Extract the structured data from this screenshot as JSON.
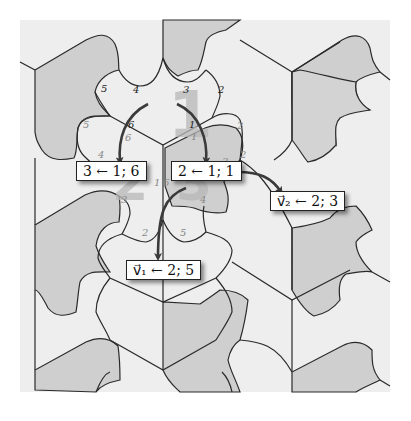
{
  "figure": {
    "colors": {
      "background": "#ffffff",
      "plane": "#eeeeee",
      "tile_light": "#f2f2f2",
      "tile_dark": "#cfcfcf",
      "outline": "#2a2a2a",
      "arrow": "#3a3a3a",
      "ghost_number": "#b8b8b8",
      "edge_label_dark": "#222222",
      "edge_label_light": "#888888"
    },
    "ghost_numbers": [
      {
        "text": "1",
        "x": 192,
        "y": 135,
        "size": 64
      },
      {
        "text": "2",
        "x": 98,
        "y": 192,
        "size": 52
      },
      {
        "text": "3",
        "x": 190,
        "y": 192,
        "size": 52
      }
    ],
    "edge_labels": [
      {
        "text": "5",
        "x": 101,
        "y": 92,
        "tone": "dark"
      },
      {
        "text": "4",
        "x": 133,
        "y": 93,
        "tone": "dark"
      },
      {
        "text": "3",
        "x": 183,
        "y": 93,
        "tone": "dark"
      },
      {
        "text": "2",
        "x": 218,
        "y": 93,
        "tone": "dark"
      },
      {
        "text": "5",
        "x": 83,
        "y": 128,
        "tone": "light"
      },
      {
        "text": "6",
        "x": 128,
        "y": 128,
        "tone": "dark"
      },
      {
        "text": "6",
        "x": 125,
        "y": 141,
        "tone": "light"
      },
      {
        "text": "1",
        "x": 189,
        "y": 128,
        "tone": "dark"
      },
      {
        "text": "1",
        "x": 191,
        "y": 140,
        "tone": "light"
      },
      {
        "text": "2",
        "x": 237,
        "y": 129,
        "tone": "light"
      },
      {
        "text": "2",
        "x": 240,
        "y": 158,
        "tone": "light"
      },
      {
        "text": "4",
        "x": 98,
        "y": 158,
        "tone": "light"
      },
      {
        "text": "3",
        "x": 222,
        "y": 165,
        "tone": "light"
      },
      {
        "text": "1",
        "x": 154,
        "y": 184,
        "tone": "light"
      },
      {
        "text": "6",
        "x": 163,
        "y": 184,
        "tone": "light"
      },
      {
        "text": "3",
        "x": 121,
        "y": 202,
        "tone": "light"
      },
      {
        "text": "4",
        "x": 200,
        "y": 202,
        "tone": "light"
      },
      {
        "text": "2",
        "x": 142,
        "y": 235,
        "tone": "light"
      },
      {
        "text": "5",
        "x": 180,
        "y": 235,
        "tone": "light"
      }
    ],
    "boxes": [
      {
        "id": "box-3-from-1-6",
        "text": "3 ← 1; 6",
        "left": 76,
        "top": 161
      },
      {
        "id": "box-2-from-1-1",
        "text": "2 ← 1; 1",
        "left": 171,
        "top": 161
      },
      {
        "id": "box-v2",
        "text": "v⃗₂ ← 2; 3",
        "left": 270,
        "top": 191
      },
      {
        "id": "box-v1",
        "text": "v⃗₁ ← 2; 5",
        "left": 126,
        "top": 260
      }
    ]
  }
}
